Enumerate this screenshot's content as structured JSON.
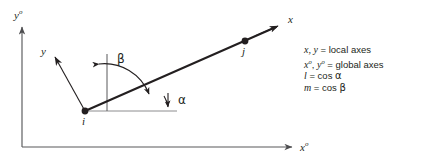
{
  "figure": {
    "nodes": [
      {
        "id": "i",
        "label": "i",
        "x": 85,
        "y": 111
      },
      {
        "id": "j",
        "label": "j",
        "x": 245,
        "y": 41
      }
    ],
    "axes": {
      "global_y_label": "y",
      "global_y_sup": "o",
      "global_x_label": "x",
      "global_x_sup": "o",
      "local_x_label": "x",
      "local_y_label": "y"
    },
    "angles": {
      "alpha": "α",
      "beta": "β"
    }
  },
  "legend": {
    "lines": [
      {
        "id": "local-axes",
        "lhs_italic": "x, y",
        "eq": " = local axes"
      },
      {
        "id": "global-axes",
        "lhs_italic": "x",
        "sup1": "o",
        "mid": ", ",
        "lhs2_italic": "y",
        "sup2": "o",
        "eq": " = global axes"
      },
      {
        "id": "l-cos-alpha",
        "lhs_italic": "l",
        "eq": " = cos ",
        "greek": "α"
      },
      {
        "id": "m-cos-beta",
        "lhs_italic": "m",
        "eq": " = cos ",
        "greek": "β"
      }
    ]
  },
  "colors": {
    "ink": "#231f20",
    "axis": "#6d6e71",
    "background": "#ffffff"
  }
}
